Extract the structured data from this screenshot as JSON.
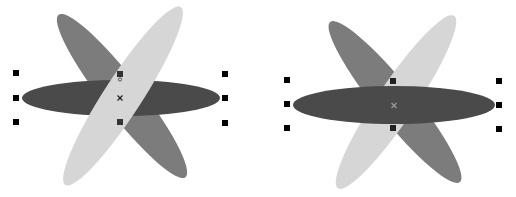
{
  "colors": {
    "dark": "#4a4a4a",
    "medium": "#7c7c7c",
    "light": "#d6d6d6",
    "handle": "#000000",
    "background": "#ffffff"
  },
  "groups": [
    {
      "name": "left",
      "top_shape": "light",
      "center": [
        120,
        98
      ],
      "handles": [
        [
          16,
          73
        ],
        [
          16,
          98
        ],
        [
          16,
          122
        ],
        [
          225,
          74
        ],
        [
          225,
          98
        ],
        [
          225,
          123
        ],
        [
          120,
          74
        ],
        [
          120,
          122
        ]
      ]
    },
    {
      "name": "right",
      "top_shape": "dark",
      "center": [
        394,
        105
      ],
      "handles": [
        [
          287,
          80
        ],
        [
          287,
          104
        ],
        [
          287,
          128
        ],
        [
          499,
          81
        ],
        [
          499,
          105
        ],
        [
          499,
          129
        ],
        [
          393,
          81
        ],
        [
          393,
          128
        ]
      ]
    }
  ]
}
